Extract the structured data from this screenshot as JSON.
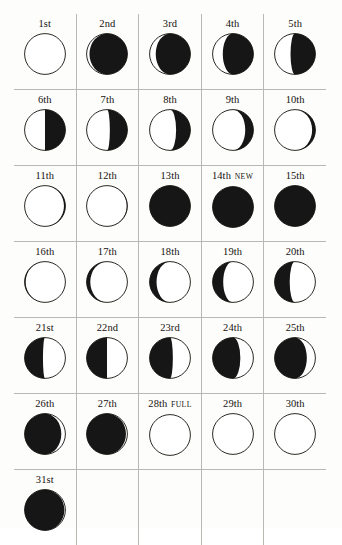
{
  "page": {
    "background_color": "#fdfdfb",
    "rule_color": "#b9b9b4",
    "ink_color": "#15110f",
    "moon_light_color": "#ffffff",
    "moon_dark_color": "#161616",
    "columns": 5,
    "rows": 7
  },
  "legend": {
    "new_tag": "NEW",
    "full_tag": "FULL"
  },
  "days": [
    {
      "label": "1st",
      "tag": "",
      "phase": -1.0,
      "name": "full-moon"
    },
    {
      "label": "2nd",
      "tag": "",
      "phase": -0.86,
      "name": "waning-gibbous"
    },
    {
      "label": "3rd",
      "tag": "",
      "phase": -0.7,
      "name": "waning-gibbous"
    },
    {
      "label": "4th",
      "tag": "",
      "phase": -0.5,
      "name": "waning-gibbous"
    },
    {
      "label": "5th",
      "tag": "",
      "phase": -0.22,
      "name": "waning-gibbous"
    },
    {
      "label": "6th",
      "tag": "",
      "phase": 0.0,
      "name": "last-quarter"
    },
    {
      "label": "7th",
      "tag": "",
      "phase": 0.14,
      "name": "waning-crescent"
    },
    {
      "label": "8th",
      "tag": "",
      "phase": 0.3,
      "name": "waning-crescent"
    },
    {
      "label": "9th",
      "tag": "",
      "phase": 0.6,
      "name": "waning-crescent"
    },
    {
      "label": "10th",
      "tag": "",
      "phase": 0.84,
      "name": "waning-crescent"
    },
    {
      "label": "11th",
      "tag": "",
      "phase": 0.93,
      "name": "waning-crescent"
    },
    {
      "label": "12th",
      "tag": "",
      "phase": 0.97,
      "name": "waning-crescent"
    },
    {
      "label": "13th",
      "tag": "",
      "phase": 1.0,
      "name": "new-moon"
    },
    {
      "label": "14th",
      "tag": "NEW",
      "phase": 1.0,
      "name": "new-moon"
    },
    {
      "label": "15th",
      "tag": "",
      "phase": 1.0,
      "name": "new-moon"
    },
    {
      "label": "16th",
      "tag": "",
      "phase": 0.95,
      "name": "waxing-crescent"
    },
    {
      "label": "17th",
      "tag": "",
      "phase": 0.82,
      "name": "waxing-crescent"
    },
    {
      "label": "18th",
      "tag": "",
      "phase": 0.66,
      "name": "waxing-crescent"
    },
    {
      "label": "19th",
      "tag": "",
      "phase": 0.48,
      "name": "waxing-crescent"
    },
    {
      "label": "20th",
      "tag": "",
      "phase": 0.26,
      "name": "waxing-crescent"
    },
    {
      "label": "21st",
      "tag": "",
      "phase": 0.1,
      "name": "waxing-crescent"
    },
    {
      "label": "22nd",
      "tag": "",
      "phase": 0.0,
      "name": "first-quarter"
    },
    {
      "label": "23rd",
      "tag": "",
      "phase": -0.14,
      "name": "waxing-gibbous"
    },
    {
      "label": "24th",
      "tag": "",
      "phase": -0.36,
      "name": "waxing-gibbous"
    },
    {
      "label": "25th",
      "tag": "",
      "phase": -0.58,
      "name": "waxing-gibbous"
    },
    {
      "label": "26th",
      "tag": "",
      "phase": -0.8,
      "name": "waxing-gibbous"
    },
    {
      "label": "27th",
      "tag": "",
      "phase": -0.93,
      "name": "waxing-gibbous"
    },
    {
      "label": "28th",
      "tag": "FULL",
      "phase": -1.0,
      "name": "full-moon"
    },
    {
      "label": "29th",
      "tag": "",
      "phase": -1.0,
      "name": "full-moon"
    },
    {
      "label": "30th",
      "tag": "",
      "phase": -1.0,
      "name": "full-moon"
    },
    {
      "label": "31st",
      "tag": "",
      "phase": -0.95,
      "name": "waning-gibbous"
    }
  ]
}
